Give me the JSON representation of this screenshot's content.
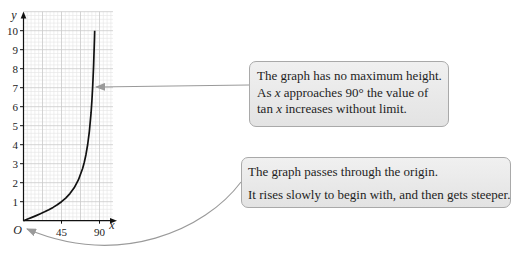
{
  "chart_data": {
    "type": "line",
    "title": "",
    "function": "y = tan x",
    "xlabel": "x",
    "ylabel": "y",
    "origin_label": "O",
    "x_ticks": [
      45,
      90
    ],
    "x_tick_labels": [
      "45",
      "90"
    ],
    "y_ticks": [
      1,
      2,
      3,
      4,
      5,
      6,
      7,
      8,
      9,
      10
    ],
    "y_tick_labels": [
      "1",
      "2",
      "3",
      "4",
      "5",
      "6",
      "7",
      "8",
      "9",
      "10"
    ],
    "xlim": [
      0,
      106
    ],
    "ylim": [
      0,
      11
    ],
    "grid": {
      "on": true,
      "major_x": 22.5,
      "minor_x": 4.5,
      "major_y": 1,
      "minor_y": 0.2
    },
    "legend": null,
    "series": [
      {
        "name": "tan x",
        "x": [
          0,
          5,
          10,
          15,
          20,
          25,
          30,
          35,
          40,
          45,
          50,
          55,
          60,
          65,
          70,
          72,
          74,
          76,
          78,
          80,
          81,
          82,
          83,
          84,
          84.29
        ],
        "y": [
          0,
          0.087,
          0.176,
          0.268,
          0.364,
          0.466,
          0.577,
          0.7,
          0.839,
          1,
          1.192,
          1.428,
          1.732,
          2.145,
          2.747,
          3.078,
          3.487,
          4.011,
          4.705,
          5.671,
          6.314,
          7.115,
          8.144,
          9.514,
          10
        ]
      }
    ],
    "annotations": [
      {
        "points_to": "curve near y = 7",
        "text": "The graph has no maximum height. As x approaches 90° the value of tan x increases without limit."
      },
      {
        "points_to": "origin O",
        "text": "The graph passes through the origin. It rises slowly to begin with, and then gets steeper."
      }
    ]
  },
  "callouts": [
    {
      "lines": [
        {
          "segments": [
            {
              "text": "The graph has no maximum height."
            }
          ]
        },
        {
          "segments": [
            {
              "text": "As "
            },
            {
              "text": "x"
            },
            {
              "text": " approaches 90° the value of"
            }
          ]
        },
        {
          "segments": [
            {
              "text": "tan "
            },
            {
              "text": "x"
            },
            {
              "text": " increases without limit."
            }
          ]
        }
      ]
    },
    {
      "lines": [
        {
          "segments": [
            {
              "text": "The graph passes through the origin."
            }
          ]
        },
        {
          "segments": [
            {
              "text": "It rises slowly to begin with, and then gets steeper."
            }
          ]
        }
      ]
    }
  ],
  "colors": {
    "curve": "#111111",
    "axis": "#111111",
    "grid_minor": "#e4e4e4",
    "grid_major": "#c9c9c9",
    "pointer_arrow": "#9a9a9a",
    "callout_border": "#a9a9a9"
  }
}
